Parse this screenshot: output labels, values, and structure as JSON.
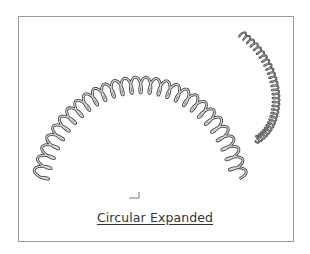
{
  "figure": {
    "caption": "Circular Expanded",
    "frame_color": "#9a9a9a",
    "spring_color": "#555555",
    "springs": [
      {
        "name": "large-arc-spring",
        "center": [
          140,
          205
        ],
        "radius_x": 102,
        "radius_y": 120,
        "start_deg": 192,
        "end_deg": 346,
        "coils": 28,
        "amplitude": 8
      },
      {
        "name": "small-curled-spring",
        "coils": 30,
        "amplitude": 3.5
      }
    ],
    "axis_marker": "coordinate-triad"
  }
}
